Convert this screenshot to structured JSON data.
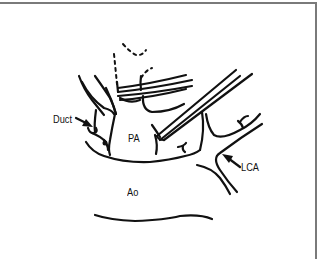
{
  "figure": {
    "type": "anatomical-line-drawing",
    "labels": {
      "duct": "Duct",
      "pa": "PA",
      "lca": "LCA",
      "ao": "Ao"
    },
    "arrows": [
      {
        "target": "duct",
        "direction": "right-down"
      },
      {
        "target": "lca",
        "direction": "left-up"
      }
    ],
    "colors": {
      "ink": "#111111",
      "frame": "#7a7a7a",
      "background": "#ffffff"
    }
  }
}
